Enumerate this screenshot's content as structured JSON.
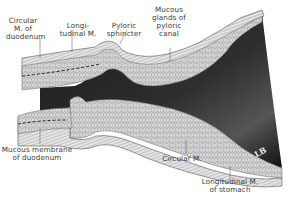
{
  "figure": {
    "labels": {
      "circular_m_duodenum": "Circular\nM. of\nduodenum",
      "longitudinal_m": "Longi-\ntudinal M.",
      "pyloric_sphincter": "Pyloric\nsphincter",
      "mucous_glands": "Mucous\nglands of\npyloric\ncanal",
      "mucous_membrane_duodenum": "Mucous membrane\nof duodenum",
      "circular_m": "Circular M.",
      "longitudinal_m_stomach": "Longitudinal M.\nof stomach"
    },
    "signature": "LB",
    "colors": {
      "background": "#ffffff",
      "lumen": "#141414",
      "tissue": "#cfcfcf",
      "tissue_dark": "#6a6a6a",
      "label_text": "#3a3a3a"
    }
  }
}
